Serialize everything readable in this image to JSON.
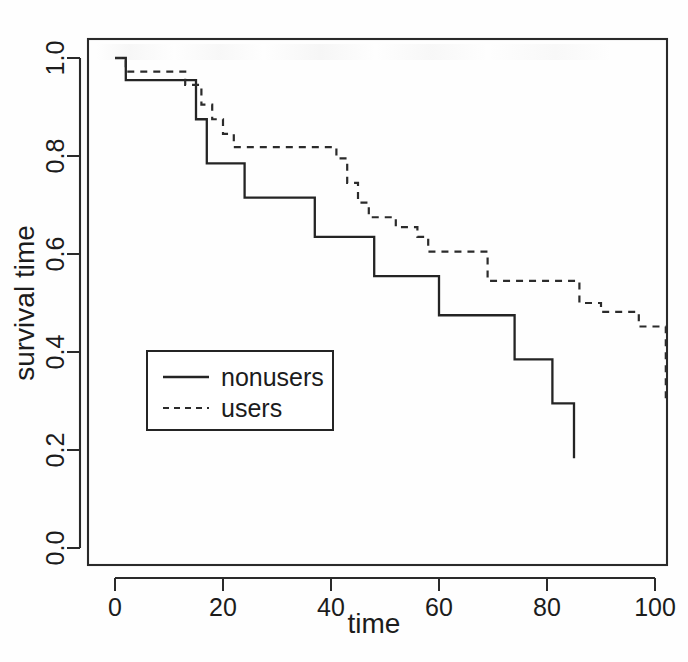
{
  "figure": {
    "kind": "kaplan-meier-survival-plot",
    "background_color": "#fefefe",
    "line_color": "#242424"
  },
  "chart_data": {
    "type": "line",
    "title": "",
    "subtitle": "",
    "xlabel": "time",
    "ylabel": "survival time",
    "xlim": [
      -2,
      105
    ],
    "ylim": [
      -0.03,
      1.05
    ],
    "xticks": [
      0,
      20,
      40,
      60,
      80,
      100
    ],
    "xticklabels": [
      "0",
      "20",
      "40",
      "60",
      "80",
      "100"
    ],
    "yticks": [
      0.0,
      0.2,
      0.4,
      0.6,
      0.8,
      1.0
    ],
    "yticklabels": [
      "0.0",
      "0.2",
      "0.4",
      "0.6",
      "0.8",
      "1.0"
    ],
    "grid": false,
    "step_type": "post",
    "legend": {
      "position": "center-left",
      "entries": [
        {
          "name": "nonusers",
          "style": "solid"
        },
        {
          "name": "users",
          "style": "dashed"
        }
      ]
    },
    "series": [
      {
        "name": "nonusers",
        "style": "solid",
        "x": [
          0,
          2,
          2,
          15,
          15,
          17,
          17,
          24,
          24,
          37,
          37,
          48,
          48,
          60,
          60,
          68,
          68,
          74,
          74,
          81,
          81,
          85,
          85
        ],
        "y": [
          1.0,
          1.0,
          0.955,
          0.955,
          0.875,
          0.875,
          0.785,
          0.785,
          0.715,
          0.715,
          0.635,
          0.635,
          0.555,
          0.555,
          0.475,
          0.475,
          0.475,
          0.475,
          0.385,
          0.385,
          0.295,
          0.295,
          0.183
        ],
        "points": [
          {
            "t": 0,
            "s": 1.0
          },
          {
            "t": 2,
            "s": 0.955
          },
          {
            "t": 15,
            "s": 0.875
          },
          {
            "t": 17,
            "s": 0.785
          },
          {
            "t": 24,
            "s": 0.715
          },
          {
            "t": 37,
            "s": 0.635
          },
          {
            "t": 48,
            "s": 0.555
          },
          {
            "t": 60,
            "s": 0.475
          },
          {
            "t": 68,
            "s": 0.475
          },
          {
            "t": 74,
            "s": 0.385
          },
          {
            "t": 81,
            "s": 0.295
          },
          {
            "t": 85,
            "s": 0.183
          }
        ]
      },
      {
        "name": "users",
        "style": "dashed",
        "x": [
          0,
          2,
          2,
          13,
          13,
          16,
          16,
          18,
          18,
          20,
          20,
          22,
          22,
          41,
          41,
          43,
          43,
          45,
          45,
          47,
          47,
          52,
          52,
          56,
          56,
          58,
          58,
          66,
          66,
          69,
          69,
          76,
          76,
          86,
          86,
          90,
          90,
          97,
          97,
          100,
          100,
          102,
          102
        ],
        "y": [
          1.0,
          1.0,
          0.972,
          0.972,
          0.945,
          0.945,
          0.905,
          0.905,
          0.875,
          0.875,
          0.845,
          0.845,
          0.818,
          0.818,
          0.795,
          0.795,
          0.745,
          0.745,
          0.705,
          0.705,
          0.675,
          0.675,
          0.655,
          0.655,
          0.635,
          0.635,
          0.605,
          0.605,
          0.605,
          0.605,
          0.545,
          0.545,
          0.545,
          0.545,
          0.5,
          0.5,
          0.482,
          0.482,
          0.452,
          0.452,
          0.452,
          0.452,
          0.295
        ],
        "points": [
          {
            "t": 0,
            "s": 1.0
          },
          {
            "t": 2,
            "s": 0.972
          },
          {
            "t": 13,
            "s": 0.945
          },
          {
            "t": 16,
            "s": 0.905
          },
          {
            "t": 18,
            "s": 0.875
          },
          {
            "t": 20,
            "s": 0.845
          },
          {
            "t": 22,
            "s": 0.818
          },
          {
            "t": 41,
            "s": 0.795
          },
          {
            "t": 43,
            "s": 0.745
          },
          {
            "t": 45,
            "s": 0.705
          },
          {
            "t": 47,
            "s": 0.675
          },
          {
            "t": 52,
            "s": 0.655
          },
          {
            "t": 56,
            "s": 0.635
          },
          {
            "t": 58,
            "s": 0.605
          },
          {
            "t": 69,
            "s": 0.545
          },
          {
            "t": 86,
            "s": 0.5
          },
          {
            "t": 90,
            "s": 0.482
          },
          {
            "t": 97,
            "s": 0.452
          },
          {
            "t": 102,
            "s": 0.295
          }
        ]
      }
    ]
  }
}
